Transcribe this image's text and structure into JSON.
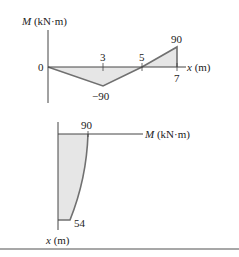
{
  "top_diagram": {
    "title": "Bending moment diagram along x",
    "y_axis_label_var": "M",
    "y_axis_label_unit": " (kN·m)",
    "x_axis_label_var": "x",
    "x_axis_label_unit": " (m)",
    "origin_label": "0",
    "tick_labels": {
      "x3": "3",
      "x5": "5",
      "x7": "7"
    },
    "value_labels": {
      "min": "−90",
      "max": "90"
    },
    "points": [
      {
        "x": 0,
        "M": 0
      },
      {
        "x": 3,
        "M": -90
      },
      {
        "x": 5,
        "M": 0
      },
      {
        "x": 7,
        "M": 90
      }
    ]
  },
  "bottom_diagram": {
    "title": "Moment vs x rotated diagram",
    "h_axis_label_var": "M",
    "h_axis_label_unit": " (kN·m)",
    "v_axis_label_var": "x",
    "v_axis_label_unit": " (m)",
    "value_labels": {
      "top": "90",
      "bottom": "54"
    }
  },
  "colors": {
    "fill": "#e6e6e6",
    "line": "#707070",
    "axis": "#444444",
    "divider": "#8a8a8a"
  }
}
